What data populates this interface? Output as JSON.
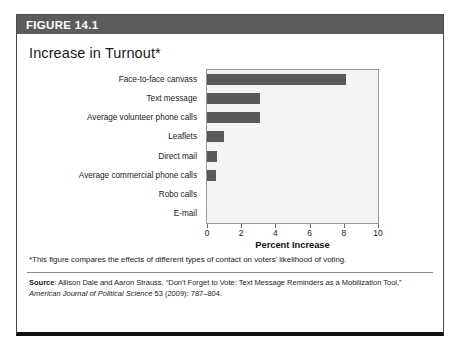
{
  "figure": {
    "header_label": "FIGURE 14.1",
    "title": "Increase in Turnout*",
    "footnote": "*This figure compares the effects of different types of contact on voters' likelihood of voting.",
    "source": {
      "label": "Source",
      "separator": ": ",
      "text_part1": "Allison Dale and Aaron Strauss, “Don't Forget to Vote: Text Message Reminders as a Mobilization Tool,” ",
      "journal": "American Journal of Political Science",
      "text_part2": " 53 (2009): 787–804."
    }
  },
  "colors": {
    "header_bar": "#5c5c5c",
    "bar_fill": "#595959",
    "plot_background": "#f4f4f4",
    "plot_border": "#9a9a9a",
    "frame_border": "#4a4a4a",
    "frame_bottom": "#111111"
  },
  "chart_data": {
    "type": "bar",
    "orientation": "horizontal",
    "title": "Increase in Turnout*",
    "xlabel": "Percent Increase",
    "ylabel": "",
    "xlim": [
      0,
      10
    ],
    "xticks": [
      0,
      2,
      4,
      6,
      8,
      10
    ],
    "grid": false,
    "legend": null,
    "categories": [
      "Face-to-face canvass",
      "Text message",
      "Average volunteer phone calls",
      "Leaflets",
      "Direct mail",
      "Average commercial phone calls",
      "Robo calls",
      "E-mail"
    ],
    "values": [
      8.1,
      3.1,
      3.1,
      1.0,
      0.6,
      0.55,
      0.0,
      0.0
    ]
  }
}
